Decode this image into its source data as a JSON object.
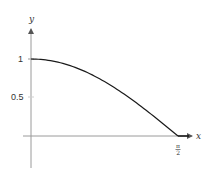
{
  "chart_data": {
    "type": "line",
    "title": "",
    "xlabel": "x",
    "ylabel": "y",
    "x_ticks": [
      {
        "value": 1.5708,
        "label": "π/2",
        "numerator": "π",
        "denominator": "2"
      }
    ],
    "y_ticks": [
      {
        "value": 1,
        "label": "1"
      },
      {
        "value": 0.5,
        "label": "0.5"
      }
    ],
    "xlim": [
      -0.1,
      1.75
    ],
    "ylim": [
      -0.4,
      1.4
    ],
    "grid": false,
    "legend": null,
    "series": [
      {
        "name": "f(x) = cos(x) for 0 ≤ x ≤ π/2, 0 for x > π/2",
        "x": [
          0,
          0.1963,
          0.3927,
          0.589,
          0.7854,
          0.9817,
          1.1781,
          1.3744,
          1.5708,
          1.7
        ],
        "y": [
          1,
          0.981,
          0.924,
          0.831,
          0.707,
          0.556,
          0.383,
          0.195,
          0,
          0
        ],
        "color": "#1a1a1a"
      }
    ],
    "colors": {
      "curve": "#1a1a1a",
      "axes": "#9a9a9a",
      "text": "#333333"
    }
  }
}
